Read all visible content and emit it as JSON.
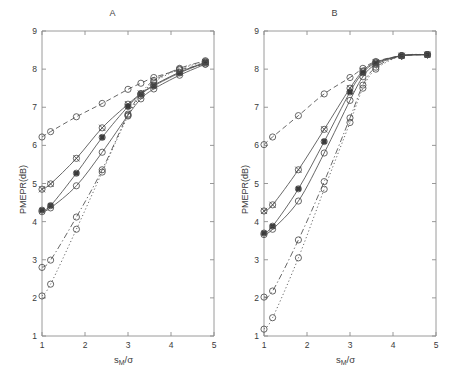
{
  "figure": {
    "panel_a_title": "A",
    "panel_b_title": "B",
    "ylabel": "PMEPR(dB)",
    "xlabel_main": "s",
    "xlabel_sub": "M",
    "xlabel_tail": "/σ"
  },
  "axes": {
    "x_ticks": [
      "1",
      "2",
      "3",
      "4",
      "5"
    ],
    "y_ticks": [
      "1",
      "2",
      "3",
      "4",
      "5",
      "6",
      "7",
      "8",
      "9"
    ]
  },
  "chart_data": [
    {
      "type": "line",
      "title": "A",
      "xlabel": "s_M/σ",
      "ylabel": "PMEPR(dB)",
      "xlim": [
        1,
        5
      ],
      "ylim": [
        1,
        9
      ],
      "xticks": [
        1,
        2,
        3,
        4,
        5
      ],
      "yticks": [
        1,
        2,
        3,
        4,
        5,
        6,
        7,
        8,
        9
      ],
      "grid": false,
      "legend": "none",
      "series": [
        {
          "name": "series-1-dashed-upper",
          "linestyle": "dashed",
          "marker": "circle-open",
          "x": [
            1.0,
            1.2,
            1.8,
            2.4,
            3.0,
            3.3,
            3.6,
            4.2,
            4.8
          ],
          "y": [
            6.22,
            6.36,
            6.75,
            7.1,
            7.47,
            7.63,
            7.78,
            7.98,
            8.13
          ]
        },
        {
          "name": "series-2-solid-marker-filled",
          "linestyle": "solid",
          "marker": "circle-cross",
          "x": [
            1.0,
            1.2,
            1.8,
            2.4,
            3.0,
            3.3,
            3.6,
            4.2,
            4.8
          ],
          "y": [
            4.85,
            4.99,
            5.66,
            6.46,
            7.08,
            7.36,
            7.58,
            7.92,
            8.18
          ]
        },
        {
          "name": "series-3-solid",
          "linestyle": "solid",
          "marker": "circle-filled",
          "x": [
            1.0,
            1.2,
            1.8,
            2.4,
            3.0,
            3.3,
            3.6,
            4.2,
            4.8
          ],
          "y": [
            4.3,
            4.42,
            5.27,
            6.21,
            7.02,
            7.34,
            7.56,
            7.9,
            8.17
          ]
        },
        {
          "name": "series-4-solid-lower",
          "linestyle": "solid",
          "marker": "circle-open",
          "x": [
            1.0,
            1.2,
            1.8,
            2.4,
            3.0,
            3.3,
            3.6,
            4.2,
            4.8
          ],
          "y": [
            4.26,
            4.36,
            4.94,
            5.82,
            6.79,
            7.22,
            7.48,
            7.84,
            8.13
          ]
        },
        {
          "name": "series-5-dashdot",
          "linestyle": "dashdot",
          "marker": "circle-open",
          "x": [
            1.0,
            1.2,
            1.8,
            2.4,
            3.0,
            3.3,
            3.6,
            4.2,
            4.8
          ],
          "y": [
            2.8,
            2.99,
            4.12,
            5.36,
            6.82,
            7.35,
            7.7,
            8.02,
            8.22
          ]
        },
        {
          "name": "series-6-dotted",
          "linestyle": "dotted",
          "marker": "circle-open",
          "x": [
            1.0,
            1.2,
            1.8,
            2.4,
            3.0,
            3.3,
            3.6,
            4.2,
            4.8
          ],
          "y": [
            2.05,
            2.36,
            3.8,
            5.3,
            6.77,
            7.3,
            7.66,
            8.0,
            8.2
          ]
        }
      ]
    },
    {
      "type": "line",
      "title": "B",
      "xlabel": "s_M/σ",
      "ylabel": "PMEPR(dB)",
      "xlim": [
        1,
        5
      ],
      "ylim": [
        1,
        9
      ],
      "xticks": [
        1,
        2,
        3,
        4,
        5
      ],
      "yticks": [
        1,
        2,
        3,
        4,
        5,
        6,
        7,
        8,
        9
      ],
      "grid": false,
      "legend": "none",
      "series": [
        {
          "name": "series-1-dashed-upper",
          "linestyle": "dashed",
          "marker": "circle-open",
          "x": [
            1.0,
            1.2,
            1.8,
            2.4,
            3.0,
            3.3,
            3.6,
            4.2,
            4.8
          ],
          "y": [
            6.02,
            6.22,
            6.78,
            7.35,
            7.78,
            8.02,
            8.2,
            8.35,
            8.38
          ]
        },
        {
          "name": "series-2-solid-marker-filled",
          "linestyle": "solid",
          "marker": "circle-cross",
          "x": [
            1.0,
            1.2,
            1.8,
            2.4,
            3.0,
            3.3,
            3.6,
            4.2,
            4.8
          ],
          "y": [
            4.28,
            4.44,
            5.36,
            6.42,
            7.5,
            7.95,
            8.18,
            8.35,
            8.38
          ]
        },
        {
          "name": "series-3-solid",
          "linestyle": "solid",
          "marker": "circle-filled",
          "x": [
            1.0,
            1.2,
            1.8,
            2.4,
            3.0,
            3.3,
            3.6,
            4.2,
            4.8
          ],
          "y": [
            3.7,
            3.88,
            4.86,
            6.1,
            7.4,
            7.9,
            8.16,
            8.35,
            8.38
          ]
        },
        {
          "name": "series-4-solid-lower",
          "linestyle": "solid",
          "marker": "circle-open",
          "x": [
            1.0,
            1.2,
            1.8,
            2.4,
            3.0,
            3.3,
            3.6,
            4.2,
            4.8
          ],
          "y": [
            3.66,
            3.8,
            4.54,
            5.8,
            7.18,
            7.8,
            8.12,
            8.35,
            8.38
          ]
        },
        {
          "name": "series-5-dashdot",
          "linestyle": "dashdot",
          "marker": "circle-open",
          "x": [
            1.0,
            1.2,
            1.8,
            2.4,
            3.0,
            3.3,
            3.6,
            4.2,
            4.8
          ],
          "y": [
            2.02,
            2.18,
            3.52,
            5.05,
            6.72,
            7.58,
            8.05,
            8.35,
            8.38
          ]
        },
        {
          "name": "series-6-dotted",
          "linestyle": "dotted",
          "marker": "circle-open",
          "x": [
            1.0,
            1.2,
            1.8,
            2.4,
            3.0,
            3.3,
            3.6,
            4.2,
            4.8
          ],
          "y": [
            1.18,
            1.48,
            3.05,
            4.85,
            6.6,
            7.5,
            8.0,
            8.35,
            8.38
          ]
        }
      ]
    }
  ]
}
